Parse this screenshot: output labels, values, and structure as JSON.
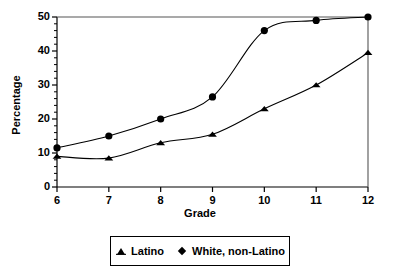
{
  "chart_data": {
    "type": "line",
    "title": "",
    "xlabel": "Grade",
    "ylabel": "Percentage",
    "x": [
      6,
      7,
      8,
      9,
      10,
      11,
      12
    ],
    "categories": [
      "6",
      "7",
      "8",
      "9",
      "10",
      "11",
      "12"
    ],
    "xlim": [
      6,
      12
    ],
    "ylim": [
      0,
      50
    ],
    "ytick_labels": [
      "0",
      "10",
      "20",
      "30",
      "40",
      "50"
    ],
    "ytick_values": [
      0,
      10,
      20,
      30,
      40,
      50
    ],
    "yminor_step": 2,
    "xtick_labels": [
      "6",
      "7",
      "8",
      "9",
      "10",
      "11",
      "12"
    ],
    "grid": false,
    "legend_position": "below-center",
    "series": [
      {
        "name": "Latino",
        "marker": "triangle",
        "color": "#000000",
        "values": [
          9,
          8.5,
          13,
          15.5,
          23,
          30,
          39.5
        ]
      },
      {
        "name": "White, non-Latino",
        "marker": "diamond",
        "color": "#000000",
        "values": [
          11.5,
          15,
          20,
          26.5,
          46,
          49,
          50
        ]
      }
    ]
  },
  "axes": {
    "y_title": "Percentage",
    "x_title": "Grade"
  },
  "legend": {
    "items": [
      {
        "label": "Latino",
        "marker": "triangle-marker-icon"
      },
      {
        "label": "White, non-Latino",
        "marker": "diamond-marker-icon"
      }
    ]
  }
}
